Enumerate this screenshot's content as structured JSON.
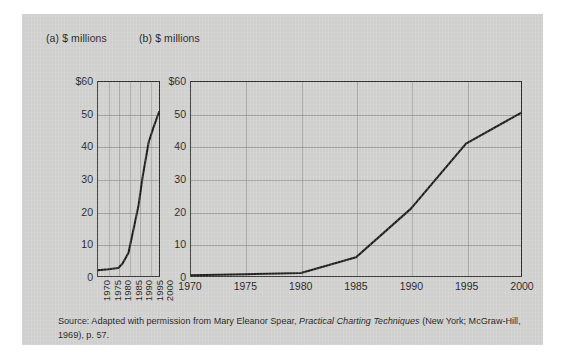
{
  "figure": {
    "background_color": "#cfcfcd",
    "panel_a": {
      "title": "(a) $ millions",
      "y_ticks": [
        "$60",
        "50",
        "40",
        "30",
        "20",
        "10",
        "0"
      ],
      "x_ticks": [
        "1970",
        "1975",
        "1980",
        "1985",
        "1990",
        "1995",
        "2000"
      ]
    },
    "panel_b": {
      "title": "(b) $ millions",
      "y_ticks": [
        "$60",
        "50",
        "40",
        "30",
        "20",
        "10",
        "0"
      ],
      "x_ticks": [
        "1970",
        "1975",
        "1980",
        "1985",
        "1990",
        "1995",
        "2000"
      ]
    }
  },
  "source": {
    "prefix": "Source: Adapted with permission from Mary Eleanor Spear,",
    "work_title": "Practical Charting Techniques",
    "suffix": "(New York; McGraw-Hill, 1969), p. 57."
  },
  "chart_data": [
    {
      "id": "panel-a",
      "type": "line",
      "title": "(a) $ millions",
      "xlabel": "",
      "ylabel": "$ millions",
      "xlim": [
        1970,
        2000
      ],
      "ylim": [
        0,
        60
      ],
      "x_ticks": [
        1970,
        1975,
        1980,
        1985,
        1990,
        1995,
        2000
      ],
      "y_ticks": [
        0,
        10,
        20,
        30,
        40,
        50,
        60
      ],
      "grid": true,
      "legend": "none",
      "aspect_note": "narrow/compressed horizontal scale exaggerating the slope",
      "x": [
        1970,
        1975,
        1980,
        1982,
        1985,
        1987,
        1990,
        1992,
        1995,
        1997,
        2000
      ],
      "values": [
        0.5,
        0.8,
        1.2,
        2.5,
        6.0,
        12.0,
        21.0,
        30.0,
        41.0,
        45.0,
        50.5
      ]
    },
    {
      "id": "panel-b",
      "type": "line",
      "title": "(b) $ millions",
      "xlabel": "",
      "ylabel": "$ millions",
      "xlim": [
        1970,
        2000
      ],
      "ylim": [
        0,
        60
      ],
      "x_ticks": [
        1970,
        1975,
        1980,
        1985,
        1990,
        1995,
        2000
      ],
      "y_ticks": [
        0,
        10,
        20,
        30,
        40,
        50,
        60
      ],
      "grid": true,
      "legend": "none",
      "aspect_note": "wide horizontal scale flattening the same series",
      "x": [
        1970,
        1975,
        1980,
        1985,
        1990,
        1995,
        2000
      ],
      "values": [
        0.5,
        0.8,
        1.2,
        6.0,
        21.0,
        41.0,
        50.5
      ]
    }
  ]
}
